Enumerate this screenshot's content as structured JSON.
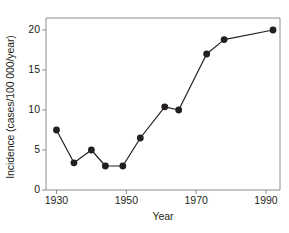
{
  "chart_data": {
    "type": "line",
    "title": "",
    "xlabel": "Year",
    "ylabel": "Incidence (cases/100 000/year)",
    "xlim": [
      1927,
      1994
    ],
    "ylim": [
      0,
      21.5
    ],
    "xticks": [
      1930,
      1950,
      1970,
      1990
    ],
    "xtick_labels": [
      "1930",
      "1950",
      "1970",
      "1990"
    ],
    "yticks": [
      0,
      5,
      10,
      15,
      20
    ],
    "ytick_labels": [
      "0",
      "5",
      "10",
      "15",
      "20"
    ],
    "grid": false,
    "legend": null,
    "marker": "filled-circle",
    "line_color": "#231f20",
    "marker_color": "#231f20",
    "axis_color": "#8c8c8c",
    "background": "#ffffff",
    "x": [
      1930,
      1935,
      1940,
      1944,
      1949,
      1954,
      1961,
      1965,
      1973,
      1978,
      1992
    ],
    "values": [
      7.5,
      3.4,
      5.0,
      3.0,
      3.0,
      6.5,
      10.4,
      10.0,
      17.0,
      18.8,
      20.0
    ],
    "points": [
      {
        "x": 1930,
        "y": 7.5
      },
      {
        "x": 1935,
        "y": 3.4
      },
      {
        "x": 1940,
        "y": 5.0
      },
      {
        "x": 1944,
        "y": 3.0
      },
      {
        "x": 1949,
        "y": 3.0
      },
      {
        "x": 1954,
        "y": 6.5
      },
      {
        "x": 1961,
        "y": 10.4
      },
      {
        "x": 1965,
        "y": 10.0
      },
      {
        "x": 1973,
        "y": 17.0
      },
      {
        "x": 1978,
        "y": 18.8
      },
      {
        "x": 1992,
        "y": 20.0
      }
    ]
  }
}
